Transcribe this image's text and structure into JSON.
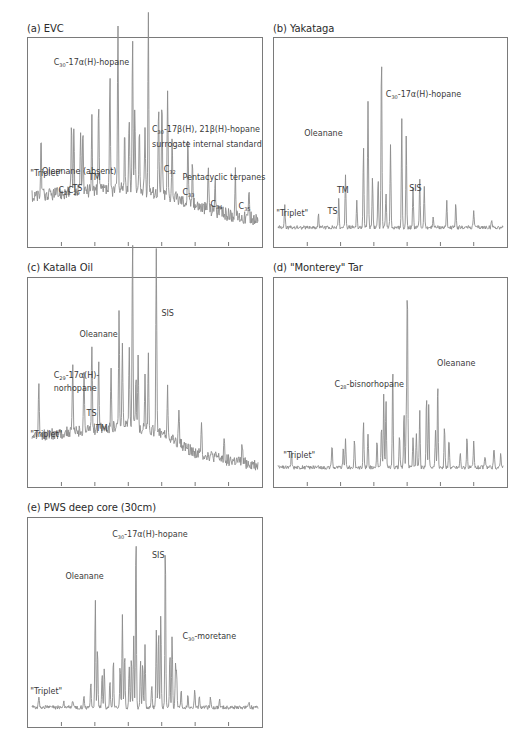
{
  "chart_data": [
    {
      "id": "a",
      "type": "line",
      "title": "(a) EVC",
      "xlabel": "",
      "ylabel": "",
      "grid": false,
      "xticks": 6,
      "baseline": 0.22,
      "noise": 0.035,
      "trend": [
        0.22,
        0.24,
        0.25,
        0.26,
        0.24,
        0.18,
        0.13,
        0.1
      ],
      "peaks": [
        {
          "x": 0.04,
          "h": 0.3
        },
        {
          "x": 0.175,
          "h": 0.36
        },
        {
          "x": 0.185,
          "h": 0.3
        },
        {
          "x": 0.215,
          "h": 0.33
        },
        {
          "x": 0.225,
          "h": 0.36
        },
        {
          "x": 0.265,
          "h": 0.4
        },
        {
          "x": 0.295,
          "h": 0.48
        },
        {
          "x": 0.345,
          "h": 0.58
        },
        {
          "x": 0.38,
          "h": 0.86
        },
        {
          "x": 0.41,
          "h": 0.3
        },
        {
          "x": 0.43,
          "h": 0.38
        },
        {
          "x": 0.445,
          "h": 0.82
        },
        {
          "x": 0.455,
          "h": 0.44
        },
        {
          "x": 0.475,
          "h": 0.3
        },
        {
          "x": 0.5,
          "h": 0.34
        },
        {
          "x": 0.515,
          "h": 0.93
        },
        {
          "x": 0.56,
          "h": 0.46
        },
        {
          "x": 0.575,
          "h": 0.5
        },
        {
          "x": 0.6,
          "h": 0.54
        },
        {
          "x": 0.62,
          "h": 0.3
        },
        {
          "x": 0.69,
          "h": 0.36
        },
        {
          "x": 0.71,
          "h": 0.22
        },
        {
          "x": 0.78,
          "h": 0.24
        },
        {
          "x": 0.81,
          "h": 0.18
        },
        {
          "x": 0.9,
          "h": 0.22
        },
        {
          "x": 0.96,
          "h": 0.16
        }
      ],
      "annotations": [
        {
          "text": "C",
          "sub": "30",
          "rest": "-17α(H)-hopane",
          "x": 0.11,
          "y": 0.13
        },
        {
          "text": "C",
          "sub": "30",
          "rest": "-17β(H), 21β(H)-hopane",
          "x": 0.53,
          "y": 0.45
        },
        {
          "text": "surrogate internal standard",
          "x": 0.53,
          "y": 0.52
        },
        {
          "text": "Oleanane (absent)",
          "x": 0.06,
          "y": 0.65
        },
        {
          "text": "\"Triplet\"",
          "x": 0.01,
          "y": 0.66
        },
        {
          "text": "TM",
          "x": 0.26,
          "y": 0.68
        },
        {
          "text": "TS",
          "x": 0.19,
          "y": 0.73
        },
        {
          "text": "C",
          "sub": "28",
          "x": 0.13,
          "y": 0.74
        },
        {
          "text": "C",
          "sub": "29",
          "x": 0.17,
          "y": 0.74
        },
        {
          "text": "C",
          "sub": "32",
          "x": 0.58,
          "y": 0.64
        },
        {
          "text": "Pentacyclic terpanes",
          "x": 0.66,
          "y": 0.68
        },
        {
          "text": "C",
          "sub": "33",
          "x": 0.66,
          "y": 0.75
        },
        {
          "text": "C",
          "sub": "34",
          "x": 0.78,
          "y": 0.81
        },
        {
          "text": "C",
          "sub": "35",
          "x": 0.9,
          "y": 0.82
        }
      ]
    },
    {
      "id": "b",
      "type": "line",
      "title": "(b) Yakataga",
      "xlabel": "",
      "ylabel": "",
      "grid": false,
      "xticks": 6,
      "baseline": 0.06,
      "noise": 0.01,
      "peaks": [
        {
          "x": 0.03,
          "h": 0.12
        },
        {
          "x": 0.18,
          "h": 0.07
        },
        {
          "x": 0.27,
          "h": 0.15
        },
        {
          "x": 0.3,
          "h": 0.28
        },
        {
          "x": 0.35,
          "h": 0.14
        },
        {
          "x": 0.38,
          "h": 0.42
        },
        {
          "x": 0.4,
          "h": 0.66
        },
        {
          "x": 0.42,
          "h": 0.26
        },
        {
          "x": 0.445,
          "h": 0.26
        },
        {
          "x": 0.46,
          "h": 0.91
        },
        {
          "x": 0.48,
          "h": 0.18
        },
        {
          "x": 0.5,
          "h": 0.42
        },
        {
          "x": 0.55,
          "h": 0.56
        },
        {
          "x": 0.57,
          "h": 0.48
        },
        {
          "x": 0.6,
          "h": 0.2
        },
        {
          "x": 0.63,
          "h": 0.26
        },
        {
          "x": 0.65,
          "h": 0.22
        },
        {
          "x": 0.69,
          "h": 0.06
        },
        {
          "x": 0.75,
          "h": 0.14
        },
        {
          "x": 0.79,
          "h": 0.12
        },
        {
          "x": 0.87,
          "h": 0.09
        },
        {
          "x": 0.95,
          "h": 0.04
        }
      ],
      "annotations": [
        {
          "text": "C",
          "sub": "30",
          "rest": "-17α(H)-hopane",
          "x": 0.48,
          "y": 0.28
        },
        {
          "text": "Oleanane",
          "x": 0.13,
          "y": 0.47
        },
        {
          "text": "TM",
          "x": 0.27,
          "y": 0.74
        },
        {
          "text": "SIS",
          "x": 0.58,
          "y": 0.73
        },
        {
          "text": "TS",
          "x": 0.23,
          "y": 0.84
        },
        {
          "text": "\"Triplet\"",
          "x": 0.01,
          "y": 0.85
        }
      ]
    },
    {
      "id": "c",
      "type": "line",
      "title": "(c) Katalla Oil",
      "xlabel": "",
      "ylabel": "",
      "grid": false,
      "xticks": 6,
      "baseline": 0.22,
      "noise": 0.03,
      "trend": [
        0.22,
        0.24,
        0.26,
        0.28,
        0.24,
        0.14,
        0.1,
        0.07
      ],
      "peaks": [
        {
          "x": 0.03,
          "h": 0.28
        },
        {
          "x": 0.18,
          "h": 0.34
        },
        {
          "x": 0.23,
          "h": 0.32
        },
        {
          "x": 0.265,
          "h": 0.46
        },
        {
          "x": 0.295,
          "h": 0.38
        },
        {
          "x": 0.35,
          "h": 0.3
        },
        {
          "x": 0.385,
          "h": 0.6
        },
        {
          "x": 0.4,
          "h": 0.42
        },
        {
          "x": 0.43,
          "h": 0.4
        },
        {
          "x": 0.445,
          "h": 0.97
        },
        {
          "x": 0.46,
          "h": 0.3
        },
        {
          "x": 0.47,
          "h": 0.36
        },
        {
          "x": 0.5,
          "h": 0.28
        },
        {
          "x": 0.515,
          "h": 0.4
        },
        {
          "x": 0.55,
          "h": 0.96
        },
        {
          "x": 0.6,
          "h": 0.24
        },
        {
          "x": 0.65,
          "h": 0.2
        },
        {
          "x": 0.75,
          "h": 0.15
        },
        {
          "x": 0.85,
          "h": 0.12
        },
        {
          "x": 0.93,
          "h": 0.1
        }
      ],
      "annotations": [
        {
          "text": "SIS",
          "x": 0.57,
          "y": 0.18
        },
        {
          "text": "Oleanane",
          "x": 0.22,
          "y": 0.28
        },
        {
          "text": "C",
          "sub": "29",
          "rest": "-17α(H)-",
          "x": 0.11,
          "y": 0.48
        },
        {
          "text": "norhopane",
          "x": 0.11,
          "y": 0.54
        },
        {
          "text": "TS",
          "x": 0.25,
          "y": 0.66
        },
        {
          "text": "TM",
          "x": 0.29,
          "y": 0.73
        },
        {
          "text": "\"Triplet\"",
          "x": 0.01,
          "y": 0.76
        }
      ]
    },
    {
      "id": "d",
      "type": "line",
      "title": "(d) \"Monterey\" Tar",
      "xlabel": "",
      "ylabel": "",
      "grid": false,
      "xticks": 6,
      "baseline": 0.06,
      "noise": 0.01,
      "peaks": [
        {
          "x": 0.06,
          "h": 0.08
        },
        {
          "x": 0.24,
          "h": 0.12
        },
        {
          "x": 0.29,
          "h": 0.1
        },
        {
          "x": 0.3,
          "h": 0.14
        },
        {
          "x": 0.34,
          "h": 0.14
        },
        {
          "x": 0.38,
          "h": 0.24
        },
        {
          "x": 0.4,
          "h": 0.18
        },
        {
          "x": 0.44,
          "h": 0.14
        },
        {
          "x": 0.46,
          "h": 0.22
        },
        {
          "x": 0.47,
          "h": 0.38
        },
        {
          "x": 0.48,
          "h": 0.34
        },
        {
          "x": 0.51,
          "h": 0.54
        },
        {
          "x": 0.54,
          "h": 0.18
        },
        {
          "x": 0.56,
          "h": 0.3
        },
        {
          "x": 0.57,
          "h": 0.26
        },
        {
          "x": 0.575,
          "h": 0.96
        },
        {
          "x": 0.6,
          "h": 0.16
        },
        {
          "x": 0.615,
          "h": 0.18
        },
        {
          "x": 0.63,
          "h": 0.3
        },
        {
          "x": 0.66,
          "h": 0.38
        },
        {
          "x": 0.67,
          "h": 0.34
        },
        {
          "x": 0.7,
          "h": 0.2
        },
        {
          "x": 0.71,
          "h": 0.45
        },
        {
          "x": 0.74,
          "h": 0.22
        },
        {
          "x": 0.76,
          "h": 0.15
        },
        {
          "x": 0.81,
          "h": 0.08
        },
        {
          "x": 0.84,
          "h": 0.16
        },
        {
          "x": 0.87,
          "h": 0.14
        },
        {
          "x": 0.92,
          "h": 0.06
        },
        {
          "x": 0.96,
          "h": 0.1
        },
        {
          "x": 0.99,
          "h": 0.08
        }
      ],
      "annotations": [
        {
          "text": "Oleanane",
          "x": 0.7,
          "y": 0.42
        },
        {
          "text": "C",
          "sub": "28",
          "rest": "-bisnorhopane",
          "x": 0.26,
          "y": 0.52
        },
        {
          "text": "\"Triplet\"",
          "x": 0.04,
          "y": 0.86
        }
      ]
    },
    {
      "id": "e",
      "type": "line",
      "title": "(e) PWS deep core (30cm)",
      "xlabel": "",
      "ylabel": "",
      "grid": false,
      "xticks": 6,
      "baseline": 0.06,
      "noise": 0.01,
      "peaks": [
        {
          "x": 0.03,
          "h": 0.06
        },
        {
          "x": 0.14,
          "h": 0.03
        },
        {
          "x": 0.18,
          "h": 0.04
        },
        {
          "x": 0.23,
          "h": 0.06
        },
        {
          "x": 0.26,
          "h": 0.14
        },
        {
          "x": 0.28,
          "h": 0.56
        },
        {
          "x": 0.29,
          "h": 0.32
        },
        {
          "x": 0.31,
          "h": 0.18
        },
        {
          "x": 0.32,
          "h": 0.2
        },
        {
          "x": 0.345,
          "h": 0.14
        },
        {
          "x": 0.36,
          "h": 0.26
        },
        {
          "x": 0.39,
          "h": 0.22
        },
        {
          "x": 0.4,
          "h": 0.48
        },
        {
          "x": 0.41,
          "h": 0.28
        },
        {
          "x": 0.43,
          "h": 0.22
        },
        {
          "x": 0.44,
          "h": 0.26
        },
        {
          "x": 0.45,
          "h": 0.38
        },
        {
          "x": 0.46,
          "h": 0.92
        },
        {
          "x": 0.48,
          "h": 0.24
        },
        {
          "x": 0.49,
          "h": 0.24
        },
        {
          "x": 0.5,
          "h": 0.32
        },
        {
          "x": 0.53,
          "h": 0.12
        },
        {
          "x": 0.55,
          "h": 0.4
        },
        {
          "x": 0.56,
          "h": 0.4
        },
        {
          "x": 0.57,
          "h": 0.48
        },
        {
          "x": 0.59,
          "h": 0.86
        },
        {
          "x": 0.61,
          "h": 0.28
        },
        {
          "x": 0.62,
          "h": 0.38
        },
        {
          "x": 0.635,
          "h": 0.22
        },
        {
          "x": 0.64,
          "h": 0.18
        },
        {
          "x": 0.66,
          "h": 0.1
        },
        {
          "x": 0.69,
          "h": 0.06
        },
        {
          "x": 0.72,
          "h": 0.1
        },
        {
          "x": 0.74,
          "h": 0.06
        },
        {
          "x": 0.79,
          "h": 0.05
        },
        {
          "x": 0.83,
          "h": 0.04
        },
        {
          "x": 0.96,
          "h": 0.03
        }
      ],
      "annotations": [
        {
          "text": "C",
          "sub": "30",
          "rest": "-17α(H)-hopane",
          "x": 0.36,
          "y": 0.09
        },
        {
          "text": "SIS",
          "x": 0.53,
          "y": 0.19
        },
        {
          "text": "Oleanane",
          "x": 0.16,
          "y": 0.29
        },
        {
          "text": "C",
          "sub": "30",
          "rest": "-moretane",
          "x": 0.66,
          "y": 0.58
        },
        {
          "text": "\"Triplet\"",
          "x": 0.01,
          "y": 0.84
        }
      ]
    }
  ]
}
